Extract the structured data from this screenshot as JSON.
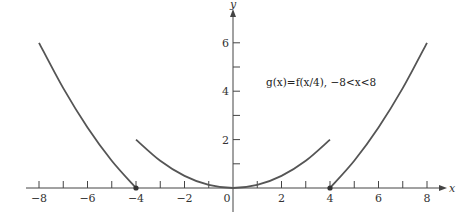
{
  "chart_data": {
    "type": "line",
    "title": "",
    "xlabel": "x",
    "ylabel": "y",
    "xlim": [
      -8.3,
      8.6
    ],
    "ylim": [
      0,
      7.3
    ],
    "grid": false,
    "x_ticks": [
      -8,
      -7,
      -6,
      -5,
      -4,
      -3,
      -2,
      -1,
      0,
      1,
      2,
      3,
      4,
      5,
      6,
      7,
      8
    ],
    "x_tick_labels": [
      "−8",
      "−6",
      "−4",
      "−2",
      "0",
      "2",
      "4",
      "6",
      "8"
    ],
    "x_tick_label_values": [
      -8,
      -6,
      -4,
      -2,
      0,
      2,
      4,
      6,
      8
    ],
    "y_ticks": [
      1,
      2,
      3,
      4,
      5,
      6
    ],
    "y_tick_labels": [
      "2",
      "4",
      "6"
    ],
    "y_tick_label_values": [
      2,
      4,
      6
    ],
    "annotation": "g(x)=f(x/4),  −8<x<8",
    "series": [
      {
        "name": "left branch",
        "x": [
          -8,
          -7,
          -6,
          -5,
          -4
        ],
        "y": [
          6,
          4.125,
          2.5,
          1.125,
          0
        ],
        "end_point_dot": [
          -4,
          0
        ]
      },
      {
        "name": "middle parabola",
        "x": [
          -4,
          -3,
          -2,
          -1,
          0,
          1,
          2,
          3,
          4
        ],
        "y": [
          2,
          1.125,
          0.5,
          0.125,
          0,
          0.125,
          0.5,
          1.125,
          2
        ]
      },
      {
        "name": "right branch",
        "x": [
          4,
          5,
          6,
          7,
          8
        ],
        "y": [
          0,
          1.125,
          2.5,
          4.125,
          6
        ],
        "end_point_dot": [
          4,
          0
        ]
      }
    ]
  },
  "colors": {
    "curve": "#555555",
    "axis": "#444444"
  }
}
